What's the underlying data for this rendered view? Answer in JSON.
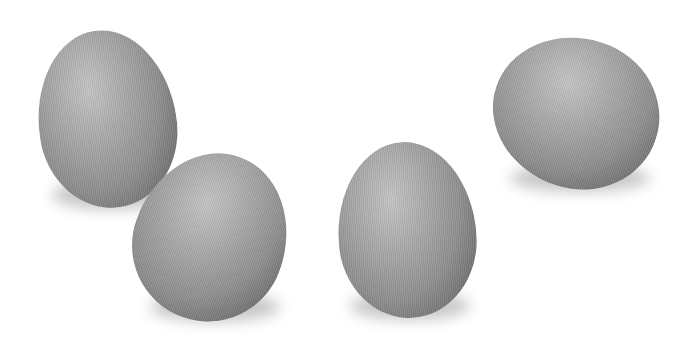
{
  "image": {
    "description": "Four gray eggs on a white background",
    "background_color": "#ffffff",
    "egg_color": "#9a9a9a",
    "objects": [
      {
        "type": "egg",
        "position": "top-left"
      },
      {
        "type": "egg",
        "position": "bottom-left-center"
      },
      {
        "type": "egg",
        "position": "bottom-center"
      },
      {
        "type": "egg",
        "position": "top-right"
      }
    ]
  }
}
